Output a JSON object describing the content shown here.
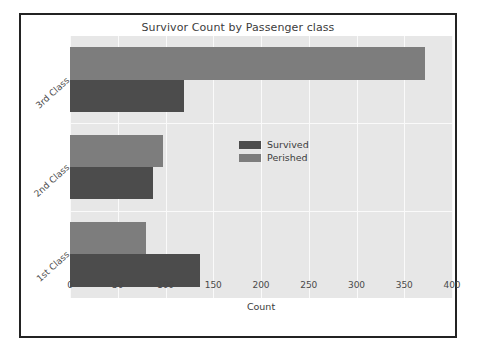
{
  "chart_data": {
    "type": "bar",
    "orientation": "horizontal",
    "title": "Survivor Count by Passenger class",
    "xlabel": "Count",
    "ylabel": "",
    "categories": [
      "3rd Class",
      "2nd Class",
      "1st Class"
    ],
    "series": [
      {
        "name": "Survived",
        "color": "#4c4c4c",
        "values": [
          119,
          87,
          136
        ]
      },
      {
        "name": "Perished",
        "color": "#7d7d7d",
        "values": [
          372,
          97,
          80
        ]
      }
    ],
    "xlim": [
      0,
      400
    ],
    "xticks": [
      0,
      50,
      100,
      150,
      200,
      250,
      300,
      350,
      400
    ],
    "xticklabels": [
      "0",
      "50",
      "100",
      "150",
      "200",
      "250",
      "300",
      "350",
      "400"
    ],
    "grid": true,
    "grid_color": "#fafafa",
    "plot_background": "#e7e7e7",
    "figure_background": "#ffffff",
    "legend_position": "center",
    "legend_entries": [
      "Survived",
      "Perished"
    ]
  }
}
